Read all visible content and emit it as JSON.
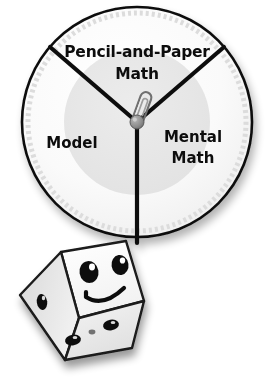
{
  "illustration": {
    "title": "Math strategy spinner with smiling die",
    "background_color": "#ffffff"
  },
  "spinner": {
    "name": "three-section-spinner",
    "center": {
      "x": 137,
      "y": 122
    },
    "radius": 115,
    "rim_color": "#111111",
    "face_color": "#fdfdfd",
    "inner_disc_color": "#e8e8e8",
    "divider_color": "#111111",
    "sections": [
      {
        "id": "pencil-and-paper-math",
        "label_line1": "Pencil-and-Paper",
        "label_line2": "Math",
        "label_x": 137,
        "label_y1": 52,
        "label_y2": 74,
        "start_angle_deg": -139,
        "end_angle_deg": -41
      },
      {
        "id": "model",
        "label_line1": "Model",
        "label_line2": "",
        "label_x": 72,
        "label_y1": 143,
        "label_y2": 143,
        "start_angle_deg": -139,
        "end_angle_deg": 90
      },
      {
        "id": "mental-math",
        "label_line1": "Mental",
        "label_line2": "Math",
        "label_x": 193,
        "label_y1": 137,
        "label_y2": 158,
        "start_angle_deg": -41,
        "end_angle_deg": 90
      }
    ],
    "pivot": {
      "name": "spinner-pivot-hub",
      "x": 137,
      "y": 122,
      "radius": 7,
      "color": "#8a8a8a"
    },
    "paperclip": {
      "name": "paperclip-spinner",
      "angle_deg": 20,
      "length": 36,
      "wire_color": "#555555",
      "points_to_section": "pencil-and-paper-math"
    }
  },
  "die": {
    "name": "smiling-die",
    "center": {
      "x": 78,
      "y": 305
    },
    "body_color": "#fbfbfb",
    "left_face_color": "#e3e3e3",
    "bottom_face_color": "#ededed",
    "outline_color": "#1a1a1a",
    "pip_color": "#111111",
    "face_expression": "smile",
    "front_face_pips": 2,
    "left_face_pips": 1,
    "bottom_face_pips": 3
  }
}
